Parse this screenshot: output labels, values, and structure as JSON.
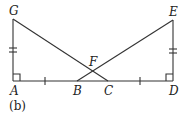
{
  "diagram": {
    "caption": "(b)",
    "points": {
      "G": {
        "label": "G",
        "x": 13,
        "y": 19
      },
      "E": {
        "label": "E",
        "x": 173,
        "y": 20
      },
      "A": {
        "label": "A",
        "x": 13,
        "y": 81
      },
      "B": {
        "label": "B",
        "x": 77,
        "y": 81
      },
      "C": {
        "label": "C",
        "x": 108,
        "y": 81
      },
      "D": {
        "label": "D",
        "x": 173,
        "y": 81
      },
      "F": {
        "label": "F",
        "x": 92,
        "y": 71
      }
    },
    "segments": [
      "AG",
      "AD",
      "GC",
      "BE",
      "DE"
    ],
    "right_angles": [
      "A",
      "D"
    ],
    "congruence_marks": {
      "single": [
        "AB",
        "CD"
      ],
      "double": [
        "AG",
        "DE"
      ]
    },
    "line_color": "#333333"
  }
}
